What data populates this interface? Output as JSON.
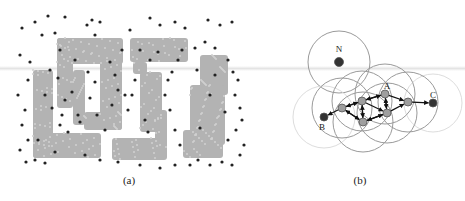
{
  "figure": {
    "panels": [
      {
        "id": "a",
        "caption": "(a)",
        "caption_pos": [
          129,
          180
        ],
        "description": "Point cloud forming block letter shapes with outlier noise points",
        "region_color": "#b3b3b3",
        "noise_color": "#222222",
        "regions": [
          {
            "x": 33,
            "y": 70,
            "w": 20,
            "h": 88
          },
          {
            "x": 33,
            "y": 133,
            "w": 68,
            "h": 25
          },
          {
            "x": 57,
            "y": 38,
            "w": 66,
            "h": 26
          },
          {
            "x": 57,
            "y": 38,
            "w": 16,
            "h": 70
          },
          {
            "x": 73,
            "y": 70,
            "w": 12,
            "h": 55
          },
          {
            "x": 100,
            "y": 60,
            "w": 22,
            "h": 70
          },
          {
            "x": 84,
            "y": 112,
            "w": 38,
            "h": 18
          },
          {
            "x": 130,
            "y": 38,
            "w": 58,
            "h": 24
          },
          {
            "x": 133,
            "y": 62,
            "w": 14,
            "h": 12
          },
          {
            "x": 140,
            "y": 72,
            "w": 22,
            "h": 60
          },
          {
            "x": 112,
            "y": 138,
            "w": 55,
            "h": 22
          },
          {
            "x": 155,
            "y": 110,
            "w": 12,
            "h": 40
          },
          {
            "x": 200,
            "y": 55,
            "w": 28,
            "h": 40
          },
          {
            "x": 190,
            "y": 85,
            "w": 35,
            "h": 60
          },
          {
            "x": 183,
            "y": 130,
            "w": 40,
            "h": 28
          }
        ],
        "noise_points": [
          [
            22,
            28
          ],
          [
            35,
            22
          ],
          [
            48,
            16
          ],
          [
            65,
            17
          ],
          [
            92,
            20
          ],
          [
            100,
            22
          ],
          [
            87,
            25
          ],
          [
            42,
            35
          ],
          [
            55,
            33
          ],
          [
            95,
            35
          ],
          [
            130,
            30
          ],
          [
            150,
            18
          ],
          [
            160,
            25
          ],
          [
            175,
            22
          ],
          [
            185,
            28
          ],
          [
            208,
            20
          ],
          [
            220,
            25
          ],
          [
            232,
            22
          ],
          [
            20,
            55
          ],
          [
            30,
            62
          ],
          [
            28,
            80
          ],
          [
            18,
            95
          ],
          [
            25,
            110
          ],
          [
            22,
            125
          ],
          [
            28,
            140
          ],
          [
            20,
            150
          ],
          [
            26,
            162
          ],
          [
            35,
            160
          ],
          [
            45,
            163
          ],
          [
            55,
            152
          ],
          [
            38,
            140
          ],
          [
            65,
            100
          ],
          [
            72,
            92
          ],
          [
            78,
            115
          ],
          [
            80,
            122
          ],
          [
            62,
            115
          ],
          [
            90,
            98
          ],
          [
            95,
            82
          ],
          [
            110,
            62
          ],
          [
            115,
            75
          ],
          [
            118,
            90
          ],
          [
            112,
            105
          ],
          [
            125,
            95
          ],
          [
            128,
            110
          ],
          [
            135,
            80
          ],
          [
            132,
            95
          ],
          [
            145,
            120
          ],
          [
            148,
            132
          ],
          [
            165,
            95
          ],
          [
            168,
            80
          ],
          [
            172,
            72
          ],
          [
            178,
            60
          ],
          [
            182,
            50
          ],
          [
            195,
            48
          ],
          [
            205,
            42
          ],
          [
            215,
            48
          ],
          [
            228,
            60
          ],
          [
            233,
            72
          ],
          [
            238,
            80
          ],
          [
            235,
            95
          ],
          [
            240,
            108
          ],
          [
            242,
            120
          ],
          [
            236,
            130
          ],
          [
            244,
            145
          ],
          [
            240,
            155
          ],
          [
            232,
            165
          ],
          [
            222,
            162
          ],
          [
            210,
            165
          ],
          [
            198,
            160
          ],
          [
            190,
            165
          ],
          [
            175,
            165
          ],
          [
            160,
            168
          ],
          [
            140,
            165
          ],
          [
            118,
            162
          ],
          [
            100,
            160
          ],
          [
            85,
            155
          ],
          [
            50,
            70
          ],
          [
            58,
            78
          ],
          [
            45,
            95
          ],
          [
            52,
            108
          ],
          [
            60,
            125
          ],
          [
            68,
            132
          ],
          [
            88,
            72
          ],
          [
            97,
            115
          ],
          [
            105,
            130
          ],
          [
            150,
            60
          ],
          [
            158,
            52
          ],
          [
            170,
            110
          ],
          [
            175,
            130
          ],
          [
            180,
            145
          ],
          [
            225,
            112
          ],
          [
            228,
            140
          ],
          [
            215,
            75
          ],
          [
            210,
            95
          ],
          [
            60,
            50
          ],
          [
            75,
            60
          ],
          [
            122,
            50
          ],
          [
            140,
            50
          ],
          [
            197,
            70
          ],
          [
            200,
            128
          ]
        ]
      },
      {
        "id": "b",
        "caption": "(b)",
        "caption_pos": [
          360,
          180
        ],
        "description": "Neighborhood graph: nodes with coverage circles and directed edges between B and C",
        "labels": [
          {
            "text": "N",
            "x": 339,
            "y": 52
          },
          {
            "text": "A",
            "x": 387,
            "y": 89
          },
          {
            "text": "B",
            "x": 322,
            "y": 130
          },
          {
            "text": "C",
            "x": 433,
            "y": 98
          }
        ],
        "circle_color": "#9a9a9a",
        "faint_circle_color": "#dddddd",
        "node_fill": "#9e9e9e",
        "endpoint_fill": "#333333",
        "nodes": [
          {
            "id": "N",
            "x": 339,
            "y": 62,
            "r": 4.5,
            "endpoint": true,
            "radius": 31,
            "faint": false
          },
          {
            "id": "B",
            "x": 324,
            "y": 117,
            "r": 4,
            "endpoint": true,
            "radius": 31,
            "faint": true
          },
          {
            "id": "C",
            "x": 433,
            "y": 103,
            "r": 4,
            "endpoint": true,
            "radius": 29,
            "faint": true
          },
          {
            "id": "n1",
            "x": 342,
            "y": 108,
            "r": 4,
            "endpoint": false,
            "radius": 30,
            "faint": false
          },
          {
            "id": "n2",
            "x": 362,
            "y": 101,
            "r": 4,
            "endpoint": false,
            "radius": 30,
            "faint": false
          },
          {
            "id": "A",
            "x": 385,
            "y": 94,
            "r": 4,
            "endpoint": false,
            "radius": 30,
            "faint": false
          },
          {
            "id": "n3",
            "x": 363,
            "y": 122,
            "r": 4,
            "endpoint": false,
            "radius": 30,
            "faint": false
          },
          {
            "id": "n4",
            "x": 387,
            "y": 113,
            "r": 4,
            "endpoint": false,
            "radius": 30,
            "faint": false
          },
          {
            "id": "n5",
            "x": 408,
            "y": 102,
            "r": 4,
            "endpoint": false,
            "radius": 30,
            "faint": false
          }
        ],
        "edges": [
          [
            "n1",
            "B"
          ],
          [
            "n1",
            "n2"
          ],
          [
            "n2",
            "n1"
          ],
          [
            "n1",
            "n3"
          ],
          [
            "n3",
            "n1"
          ],
          [
            "n2",
            "A"
          ],
          [
            "A",
            "n2"
          ],
          [
            "n2",
            "n3"
          ],
          [
            "n3",
            "n2"
          ],
          [
            "A",
            "n4"
          ],
          [
            "n4",
            "A"
          ],
          [
            "n3",
            "n4"
          ],
          [
            "n4",
            "n3"
          ],
          [
            "A",
            "n5"
          ],
          [
            "n4",
            "n5"
          ],
          [
            "n2",
            "n4"
          ],
          [
            "n5",
            "C"
          ]
        ]
      }
    ]
  }
}
